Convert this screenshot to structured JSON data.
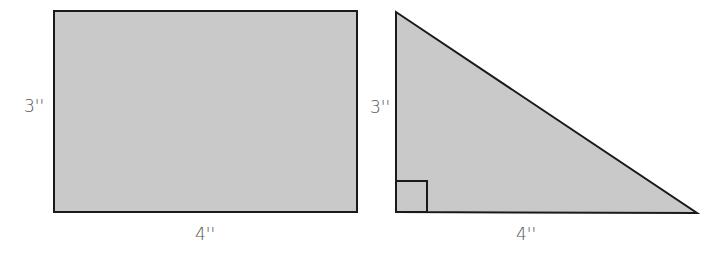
{
  "figures": {
    "rectangle": {
      "width_label": "4''",
      "height_label": "3''"
    },
    "triangle": {
      "base_label": "4''",
      "height_label": "3''",
      "right_angle_marker": true
    }
  },
  "colors": {
    "fill": "#c9c9c9",
    "stroke": "#1a1a1a",
    "label": "#555555"
  }
}
